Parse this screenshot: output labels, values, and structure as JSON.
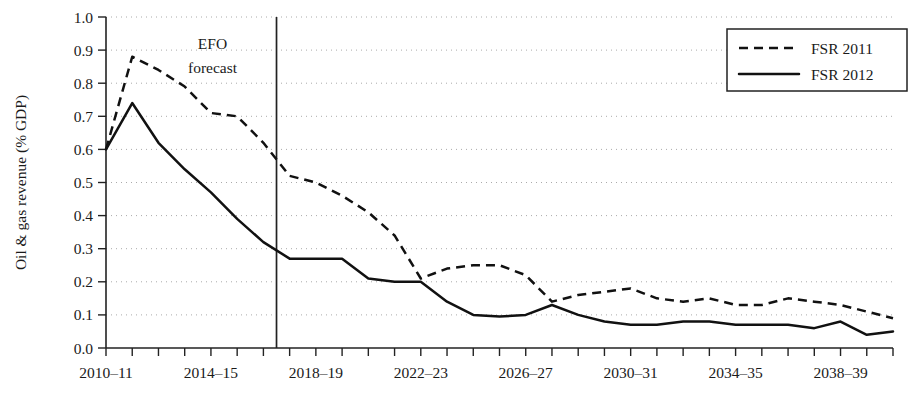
{
  "chart_data": {
    "type": "line",
    "title": "",
    "xlabel": "",
    "ylabel": "Oil & gas revenue (% GDP)",
    "ylim": [
      0.0,
      1.0
    ],
    "ytick_labels": [
      "0.0",
      "0.1",
      "0.2",
      "0.3",
      "0.4",
      "0.5",
      "0.6",
      "0.7",
      "0.8",
      "0.9",
      "1.0"
    ],
    "ytick_values": [
      0.0,
      0.1,
      0.2,
      0.3,
      0.4,
      0.5,
      0.6,
      0.7,
      0.8,
      0.9,
      1.0
    ],
    "grid": "horizontal-dotted",
    "legend_position": "top-right",
    "categories": [
      "2010-11",
      "2011-12",
      "2012-13",
      "2013-14",
      "2014-15",
      "2015-16",
      "2016-17",
      "2017-18",
      "2018-19",
      "2019-20",
      "2020-21",
      "2021-22",
      "2022-23",
      "2023-24",
      "2024-25",
      "2025-26",
      "2026-27",
      "2027-28",
      "2028-29",
      "2029-30",
      "2030-31",
      "2031-32",
      "2032-33",
      "2033-34",
      "2034-35",
      "2035-36",
      "2036-37",
      "2037-38",
      "2038-39",
      "2039-40",
      "2040-41"
    ],
    "xtick_labels": [
      "2010-11",
      "2014-15",
      "2018-19",
      "2022-23",
      "2026-27",
      "2030-31",
      "2034-35",
      "2038-39"
    ],
    "xtick_label_indices": [
      0,
      4,
      8,
      12,
      16,
      20,
      24,
      28
    ],
    "series": [
      {
        "name": "FSR 2011",
        "style": "dashed",
        "color": "#111111",
        "values": [
          0.6,
          0.88,
          0.84,
          0.79,
          0.71,
          0.7,
          0.62,
          0.52,
          0.5,
          0.46,
          0.41,
          0.34,
          0.21,
          0.24,
          0.25,
          0.25,
          0.22,
          0.14,
          0.16,
          0.17,
          0.18,
          0.15,
          0.14,
          0.15,
          0.13,
          0.13,
          0.15,
          0.14,
          0.13,
          0.11,
          0.09
        ]
      },
      {
        "name": "FSR 2012",
        "style": "solid",
        "color": "#111111",
        "values": [
          0.6,
          0.74,
          0.62,
          0.54,
          0.47,
          0.39,
          0.32,
          0.27,
          0.27,
          0.27,
          0.21,
          0.2,
          0.2,
          0.14,
          0.1,
          0.095,
          0.1,
          0.13,
          0.1,
          0.08,
          0.07,
          0.07,
          0.08,
          0.08,
          0.07,
          0.07,
          0.07,
          0.06,
          0.08,
          0.04,
          0.05
        ]
      }
    ],
    "annotations": [
      {
        "name": "efo-forecast",
        "lines": [
          "EFO",
          "forecast"
        ],
        "vline_at_index": 6.5
      }
    ]
  },
  "legend": {
    "entries": [
      {
        "label": "FSR 2011",
        "style": "dashed"
      },
      {
        "label": "FSR 2012",
        "style": "solid"
      }
    ]
  },
  "axis": {
    "y_title": "Oil & gas revenue (% GDP)"
  }
}
